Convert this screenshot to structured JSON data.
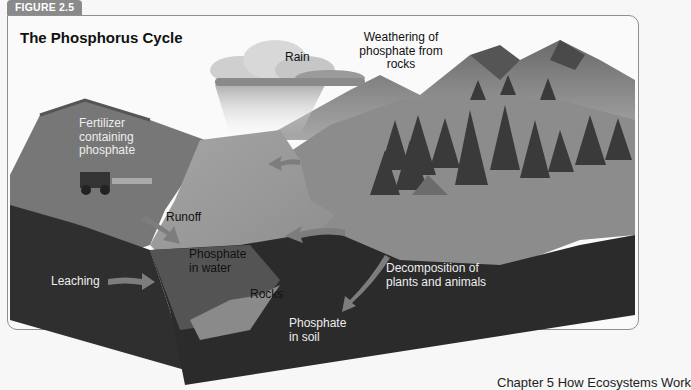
{
  "figure": {
    "tab_label": "FIGURE 2.5",
    "title": "The Phosphorus Cycle"
  },
  "labels": {
    "rain": "Rain",
    "weathering": [
      "Weathering of",
      "phosphate from",
      "rocks"
    ],
    "fertilizer": [
      "Fertilizer",
      "containing",
      "phosphate"
    ],
    "runoff": "Runoff",
    "phosphate_water": [
      "Phosphate",
      "in water"
    ],
    "leaching": "Leaching",
    "rocks": "Rocks",
    "decomposition": [
      "Decomposition of",
      "plants and animals"
    ],
    "phosphate_soil": [
      "Phosphate",
      "in soil"
    ]
  },
  "footer": {
    "text": "Chapter 5    How Ecosystems Work"
  },
  "colors": {
    "tab": "#8a8a8a",
    "frame_border": "#8f8f8f",
    "soil": "#2e2e2e",
    "water": "#9a9a9a",
    "arrow": "#7a7a7a"
  }
}
